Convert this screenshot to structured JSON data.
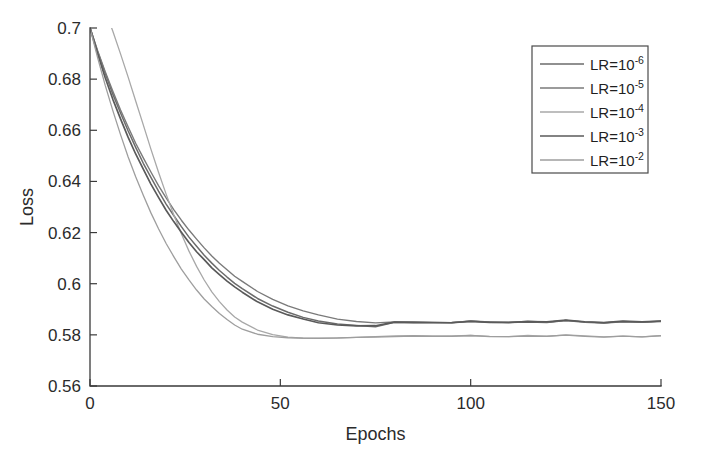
{
  "chart_data": {
    "type": "line",
    "title": "",
    "xlabel": "Epochs",
    "ylabel": "Loss",
    "xlim": [
      0,
      150
    ],
    "ylim": [
      0.56,
      0.7
    ],
    "xticks": [
      0,
      50,
      100,
      150
    ],
    "xtick_labels": [
      "0",
      "50",
      "100",
      "150"
    ],
    "yticks": [
      0.56,
      0.58,
      0.6,
      0.62,
      0.64,
      0.66,
      0.68,
      0.7
    ],
    "ytick_labels": [
      "0.56",
      "0.58",
      "0.6",
      "0.62",
      "0.64",
      "0.66",
      "0.68",
      "0.7"
    ],
    "grid": false,
    "legend_position": "upper right",
    "legend_entries": [
      {
        "label": "LR=10",
        "exponent": "-6",
        "color": "#6b6b6b"
      },
      {
        "label": "LR=10",
        "exponent": "-5",
        "color": "#7a7a7a"
      },
      {
        "label": "LR=10",
        "exponent": "-4",
        "color": "#a8a8a8"
      },
      {
        "label": "LR=10",
        "exponent": "-3",
        "color": "#5a5a5a"
      },
      {
        "label": "LR=10",
        "exponent": "-2",
        "color": "#9e9e9e"
      }
    ],
    "x": [
      0,
      2,
      4,
      6,
      8,
      10,
      12,
      14,
      16,
      18,
      20,
      22,
      24,
      26,
      28,
      30,
      32,
      34,
      36,
      38,
      40,
      44,
      48,
      52,
      56,
      60,
      65,
      70,
      75,
      80,
      85,
      90,
      95,
      100,
      105,
      110,
      115,
      120,
      125,
      130,
      135,
      140,
      145,
      150
    ],
    "series": [
      {
        "name": "LR=10^-6",
        "color": "#6b6b6b",
        "width": 1.5,
        "values": [
          0.7,
          0.6908,
          0.6822,
          0.6742,
          0.6668,
          0.6598,
          0.6533,
          0.6472,
          0.6415,
          0.6362,
          0.6312,
          0.6266,
          0.6223,
          0.6183,
          0.6146,
          0.6112,
          0.6081,
          0.6052,
          0.6026,
          0.6002,
          0.598,
          0.5942,
          0.5912,
          0.5888,
          0.5869,
          0.5855,
          0.5843,
          0.5836,
          0.5832,
          0.5849,
          0.5848,
          0.5847,
          0.5847,
          0.5853,
          0.5849,
          0.5848,
          0.5851,
          0.5849,
          0.5855,
          0.585,
          0.5846,
          0.5851,
          0.5848,
          0.5852
        ]
      },
      {
        "name": "LR=10^-5",
        "color": "#7a7a7a",
        "width": 1.4,
        "values": [
          0.7,
          0.6912,
          0.683,
          0.6753,
          0.6681,
          0.6613,
          0.655,
          0.6491,
          0.6436,
          0.6384,
          0.6336,
          0.6291,
          0.6249,
          0.621,
          0.6174,
          0.614,
          0.6109,
          0.608,
          0.6054,
          0.603,
          0.6008,
          0.5969,
          0.5938,
          0.5913,
          0.5893,
          0.5877,
          0.5862,
          0.5852,
          0.5846,
          0.5851,
          0.585,
          0.5849,
          0.5848,
          0.5854,
          0.585,
          0.5849,
          0.5852,
          0.585,
          0.5856,
          0.5851,
          0.5847,
          0.5852,
          0.5849,
          0.5853
        ]
      },
      {
        "name": "LR=10^-4",
        "color": "#a8a8a8",
        "width": 1.3,
        "values": [
          0.722,
          0.7148,
          0.707,
          0.6988,
          0.69,
          0.6808,
          0.6714,
          0.662,
          0.6527,
          0.6437,
          0.6351,
          0.627,
          0.6195,
          0.6127,
          0.6067,
          0.6014,
          0.5969,
          0.593,
          0.5898,
          0.5871,
          0.5849,
          0.5818,
          0.58,
          0.5791,
          0.5787,
          0.5786,
          0.5788,
          0.5791,
          0.5793,
          0.5795,
          0.5796,
          0.5796,
          0.5795,
          0.5798,
          0.5795,
          0.5794,
          0.5797,
          0.5795,
          0.5799,
          0.5795,
          0.5792,
          0.5796,
          0.5793,
          0.5797
        ]
      },
      {
        "name": "LR=10^-3",
        "color": "#5a5a5a",
        "width": 1.7,
        "values": [
          0.7,
          0.6898,
          0.6806,
          0.6722,
          0.6645,
          0.6574,
          0.6508,
          0.6447,
          0.639,
          0.6337,
          0.6288,
          0.6243,
          0.6201,
          0.6162,
          0.6126,
          0.6093,
          0.6063,
          0.6035,
          0.601,
          0.5987,
          0.5966,
          0.593,
          0.5901,
          0.5878,
          0.5861,
          0.5848,
          0.5838,
          0.5834,
          0.5835,
          0.585,
          0.5849,
          0.5848,
          0.5848,
          0.5854,
          0.585,
          0.5849,
          0.5852,
          0.585,
          0.5857,
          0.5852,
          0.5848,
          0.5853,
          0.585,
          0.5854
        ]
      },
      {
        "name": "LR=10^-2",
        "color": "#9e9e9e",
        "width": 1.3,
        "values": [
          0.7,
          0.6884,
          0.6776,
          0.6676,
          0.6583,
          0.6497,
          0.6418,
          0.6345,
          0.6277,
          0.6215,
          0.6158,
          0.6106,
          0.6058,
          0.6015,
          0.5976,
          0.5941,
          0.591,
          0.5883,
          0.5859,
          0.5838,
          0.5821,
          0.5803,
          0.5794,
          0.5789,
          0.5787,
          0.5786,
          0.5788,
          0.579,
          0.5792,
          0.5794,
          0.5795,
          0.5795,
          0.5794,
          0.5797,
          0.5794,
          0.5793,
          0.5796,
          0.5794,
          0.5798,
          0.5794,
          0.5791,
          0.5795,
          0.5792,
          0.5796
        ]
      }
    ]
  }
}
